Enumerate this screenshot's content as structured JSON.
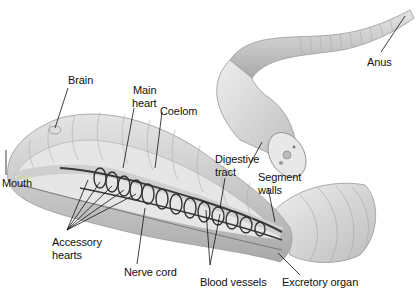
{
  "diagram": {
    "labels": {
      "brain": "Brain",
      "main_heart_1": "Main",
      "main_heart_2": "heart",
      "coelom": "Coelom",
      "mouth": "Mouth",
      "digestive_1": "Digestive",
      "digestive_2": "tract",
      "segment_1": "Segment",
      "segment_2": "walls",
      "accessory_1": "Accessory",
      "accessory_2": "hearts",
      "nerve_cord": "Nerve cord",
      "blood_vessels": "Blood vessels",
      "excretory_organ": "Excretory organ",
      "anus": "Anus"
    }
  }
}
